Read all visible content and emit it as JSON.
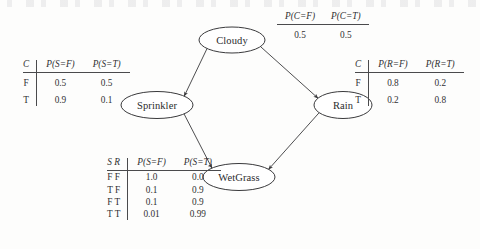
{
  "figure": {
    "type": "bayesian-network",
    "title": "",
    "nodes": [
      {
        "id": "cloudy",
        "label": "Cloudy",
        "x": 232,
        "y": 40,
        "rx": 33,
        "ry": 13
      },
      {
        "id": "sprinkler",
        "label": "Sprinkler",
        "x": 157,
        "y": 105,
        "rx": 36,
        "ry": 13.5
      },
      {
        "id": "rain",
        "label": "Rain",
        "x": 343,
        "y": 105,
        "rx": 29,
        "ry": 13.5
      },
      {
        "id": "wetgrass",
        "label": "WetGrass",
        "x": 239,
        "y": 177,
        "rx": 36,
        "ry": 13.5
      }
    ],
    "edges": [
      {
        "from": "cloudy",
        "to": "sprinkler",
        "label": ""
      },
      {
        "from": "cloudy",
        "to": "rain",
        "label": ""
      },
      {
        "from": "sprinkler",
        "to": "wetgrass",
        "label": ""
      },
      {
        "from": "rain",
        "to": "wetgrass",
        "label": ""
      }
    ],
    "stroke_color": "#3a3a3c",
    "background_color": "#fdfdfc"
  },
  "tables": {
    "cloudy": {
      "name": "cloudy-cpt",
      "cond_header": "",
      "headers": [
        "P(C=F)",
        "P(C=T)"
      ],
      "rows": [
        {
          "cond": "",
          "values": [
            "0.5",
            "0.5"
          ]
        }
      ]
    },
    "sprinkler": {
      "name": "sprinkler-cpt",
      "cond_header": "C",
      "headers": [
        "P(S=F)",
        "P(S=T)"
      ],
      "rows": [
        {
          "cond": "F",
          "values": [
            "0.5",
            "0.5"
          ]
        },
        {
          "cond": "T",
          "values": [
            "0.9",
            "0.1"
          ]
        }
      ]
    },
    "rain": {
      "name": "rain-cpt",
      "cond_header": "C",
      "headers": [
        "P(R=F)",
        "P(R=T)"
      ],
      "rows": [
        {
          "cond": "F",
          "values": [
            "0.8",
            "0.2"
          ]
        },
        {
          "cond": "T",
          "values": [
            "0.2",
            "0.8"
          ]
        }
      ]
    },
    "wetgrass": {
      "name": "wetgrass-cpt",
      "cond_header": "S R",
      "headers": [
        "P(S=F)",
        "P(S=T)"
      ],
      "rows": [
        {
          "cond": "F F",
          "values": [
            "1.0",
            "0.0"
          ]
        },
        {
          "cond": "T F",
          "values": [
            "0.1",
            "0.9"
          ]
        },
        {
          "cond": "F T",
          "values": [
            "0.1",
            "0.9"
          ]
        },
        {
          "cond": "T T",
          "values": [
            "0.01",
            "0.99"
          ]
        }
      ]
    }
  }
}
